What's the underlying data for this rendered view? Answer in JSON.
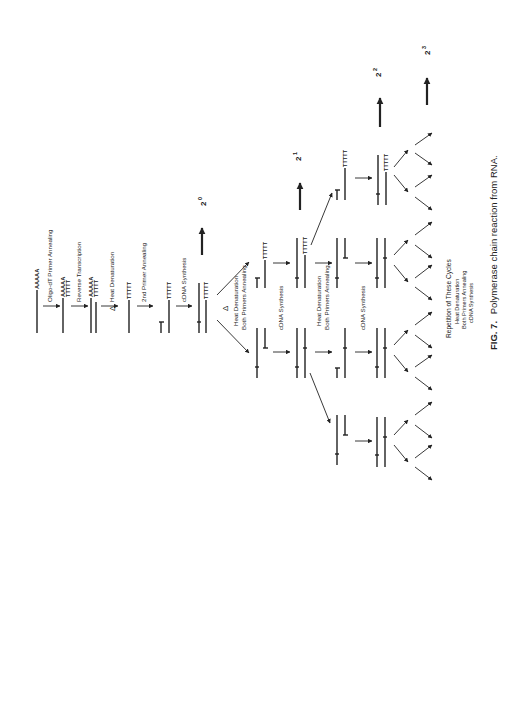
{
  "figure": {
    "caption_label": "FIG. 7.",
    "caption_text": "Polymerase chain reaction from RNA.",
    "orientation": "rotated 90° counter-clockwise"
  },
  "steps": {
    "poly_a": "AAAAA",
    "oligo_dt": "TTTTT",
    "primer_annealing": "Oligo-dT Primer Annealing",
    "reverse_transcription": "Reverse Transcription",
    "heat_denaturation": "Heat Denaturation",
    "delta": "Δ",
    "second_primer": "2nd Primer Annealing",
    "cdna_synthesis": "cDNA Synthesis",
    "cdna_synthesis_2": "cDNA Synthesis",
    "cdna_synthesis_3": "cDNA Synthesis",
    "heat_denat_both_1": "Heat Denaturation",
    "both_primers_1": "Both Primers Annealing",
    "heat_denat_both_2": "Heat Denaturation",
    "both_primers_2": "Both Primers Annealing"
  },
  "amplification": {
    "base": "2",
    "exponents": [
      "0",
      "1",
      "2",
      "3"
    ]
  },
  "repetition": {
    "title": "Repetition of These Cycles",
    "items": [
      "Heat Denaturation",
      "Both Primers Annealing",
      "cDNA Synthesis"
    ]
  }
}
